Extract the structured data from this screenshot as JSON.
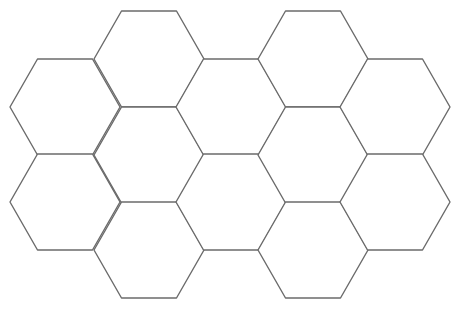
{
  "diagram": {
    "type": "hexagon-grid",
    "orientation": "flat-top",
    "stroke_color": "#6b6b6b",
    "background": "#ffffff",
    "hex": {
      "half_width": 55,
      "half_height": 48
    },
    "cells": [
      {
        "col": 0,
        "cx": 65,
        "cy": 107
      },
      {
        "col": 0,
        "cx": 65,
        "cy": 202
      },
      {
        "col": 1,
        "cx": 149,
        "cy": 59
      },
      {
        "col": 1,
        "cx": 149,
        "cy": 155
      },
      {
        "col": 1,
        "cx": 149,
        "cy": 250
      },
      {
        "col": 2,
        "cx": 231,
        "cy": 107
      },
      {
        "col": 2,
        "cx": 231,
        "cy": 202
      },
      {
        "col": 3,
        "cx": 313,
        "cy": 59
      },
      {
        "col": 3,
        "cx": 313,
        "cy": 155
      },
      {
        "col": 3,
        "cx": 313,
        "cy": 250
      },
      {
        "col": 4,
        "cx": 395,
        "cy": 107
      },
      {
        "col": 4,
        "cx": 395,
        "cy": 202
      }
    ]
  }
}
